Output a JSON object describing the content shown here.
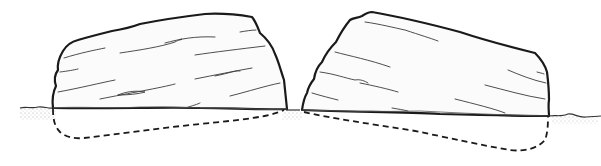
{
  "diagram": {
    "elements": [
      {
        "id": "left-boulder",
        "label": ""
      },
      {
        "id": "right-boulder",
        "label": ""
      },
      {
        "id": "ground-line",
        "label": ""
      }
    ],
    "colors": {
      "stroke": "#1a1a1a",
      "fill": "#fbfbfb",
      "background": "#ffffff"
    }
  }
}
